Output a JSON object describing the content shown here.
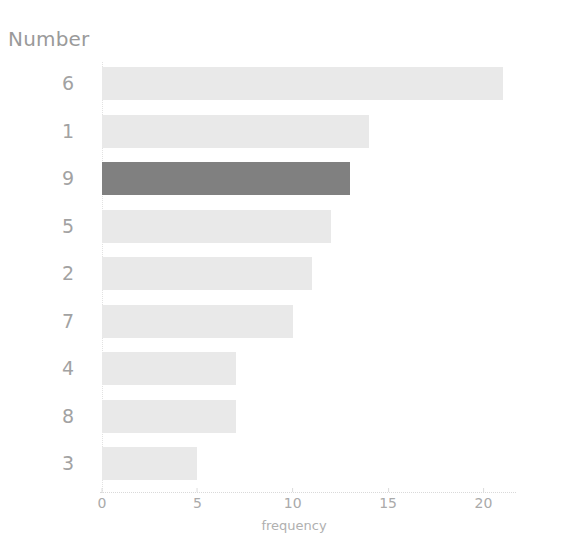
{
  "chart_data": {
    "type": "bar",
    "orientation": "horizontal",
    "title": "",
    "xlabel": "frequency",
    "ylabel": "Number",
    "categories": [
      "6",
      "1",
      "9",
      "5",
      "2",
      "7",
      "4",
      "8",
      "3"
    ],
    "values": [
      21,
      14,
      13,
      12,
      11,
      10,
      7,
      7,
      5
    ],
    "xticks": [
      0,
      5,
      10,
      15,
      20
    ],
    "xlim": [
      0,
      21.6
    ],
    "grid": false,
    "legend": null,
    "highlight_category": "9",
    "colors": {
      "bar": "#e9e9e9",
      "bar_highlight": "#808080",
      "tick_label": "#aaaaaa",
      "axis_title": "#9a9a9a",
      "category_label": "#a2a2a2",
      "axis_line": "#d9d9d9",
      "background": "#ffffff"
    }
  }
}
